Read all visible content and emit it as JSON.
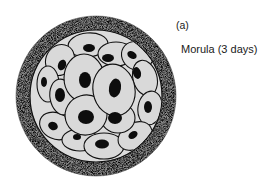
{
  "figure": {
    "panel_label": "(a)",
    "caption": "Morula (3 days)",
    "subject": "morula",
    "colors": {
      "background": "#ffffff",
      "zona_pellucida": "#6b6b6b",
      "cytoplasm": "#d9d9d9",
      "nucleus": "#0d0d0d",
      "outline": "#111111",
      "text": "#1a1a1a"
    }
  }
}
